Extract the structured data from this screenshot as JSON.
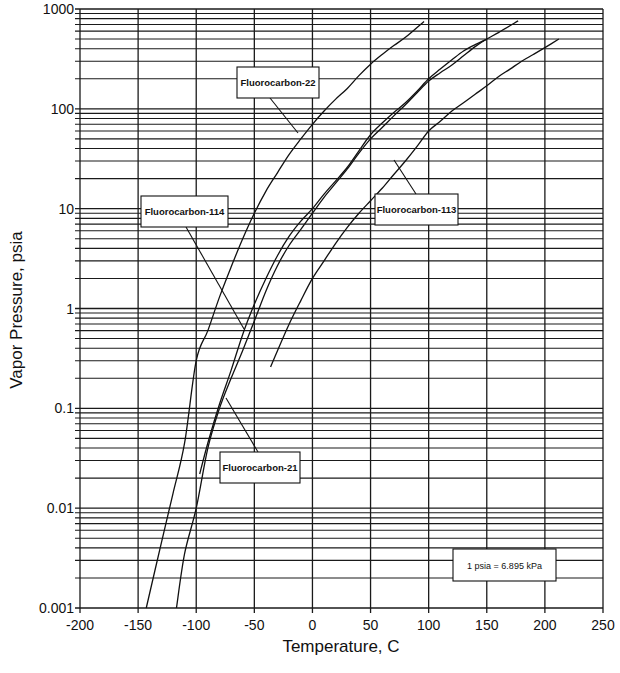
{
  "chart_data": {
    "type": "line",
    "title": "",
    "xlabel": "Temperature, C",
    "ylabel": "Vapor Pressure, psia",
    "xlim": [
      -200,
      250
    ],
    "ylim": [
      0.001,
      1000
    ],
    "yscale": "log",
    "grid": true,
    "x_ticks": [
      -200,
      -150,
      -100,
      -50,
      0,
      50,
      100,
      150,
      200,
      250
    ],
    "x_tick_labels": [
      "-200",
      "-150",
      "-100",
      "-50",
      "0",
      "50",
      "100",
      "150",
      "200",
      "250"
    ],
    "y_ticks": [
      0.001,
      0.01,
      0.1,
      1,
      10,
      100,
      1000
    ],
    "y_tick_labels": [
      "0.001",
      "0.01",
      "0.1",
      "1",
      "10",
      "100",
      "1000"
    ],
    "legend_position": "inline callout labels",
    "annotations": [
      {
        "text": "Fluorocarbon-22",
        "box": [
          237,
          67,
          82,
          31
        ],
        "pointer": [
          [
            270,
            98
          ],
          [
            298,
            133
          ]
        ]
      },
      {
        "text": "Fluorocarbon-114",
        "box": [
          141,
          196,
          87,
          31
        ],
        "pointer": [
          [
            186,
            227
          ],
          [
            244,
            329
          ]
        ]
      },
      {
        "text": "Fluorocarbon-113",
        "box": [
          375,
          194,
          83,
          31
        ],
        "pointer": [
          [
            416,
            194
          ],
          [
            394,
            160
          ]
        ]
      },
      {
        "text": "Fluorocarbon-21",
        "box": [
          220,
          452,
          80,
          31
        ],
        "pointer": [
          [
            258,
            452
          ],
          [
            226,
            398
          ]
        ]
      },
      {
        "text": "1 psia = 6.895 kPa",
        "box": [
          453,
          549,
          103,
          32
        ],
        "pointer": []
      }
    ],
    "series": [
      {
        "name": "Fluorocarbon-22",
        "x": [
          -143,
          -130,
          -120,
          -110,
          -100,
          -90,
          -80,
          -70,
          -60,
          -50,
          -40,
          -30,
          -20,
          -10,
          0,
          10,
          20,
          30,
          40,
          50,
          60,
          70,
          80,
          96
        ],
        "y": [
          0.001,
          0.0045,
          0.014,
          0.045,
          0.3,
          0.6,
          1.3,
          2.6,
          5.0,
          9.0,
          15,
          23,
          35,
          50,
          70,
          95,
          125,
          160,
          215,
          280,
          350,
          430,
          520,
          750
        ]
      },
      {
        "name": "Fluorocarbon-21",
        "x": [
          -97,
          -90,
          -80,
          -70,
          -60,
          -50,
          -40,
          -30,
          -20,
          -10,
          0,
          10,
          20,
          30,
          40,
          50,
          60,
          70,
          80,
          90,
          100,
          110,
          120,
          130,
          140,
          150
        ],
        "y": [
          0.022,
          0.045,
          0.11,
          0.24,
          0.55,
          1.1,
          2.0,
          3.4,
          5.3,
          7.5,
          10,
          14,
          19,
          26,
          38,
          55,
          72,
          92,
          115,
          150,
          200,
          250,
          310,
          380,
          440,
          500
        ]
      },
      {
        "name": "Fluorocarbon-114",
        "x": [
          -117,
          -110,
          -100,
          -90,
          -80,
          -70,
          -60,
          -50,
          -40,
          -30,
          -20,
          -10,
          0,
          10,
          20,
          30,
          40,
          50,
          60,
          70,
          80,
          90,
          100,
          110,
          120,
          130,
          140,
          150,
          160,
          177
        ],
        "y": [
          0.001,
          0.0035,
          0.01,
          0.04,
          0.1,
          0.2,
          0.38,
          0.75,
          1.5,
          2.7,
          4.3,
          6.2,
          9,
          13,
          18,
          25,
          36,
          50,
          65,
          85,
          110,
          145,
          190,
          230,
          275,
          340,
          420,
          500,
          580,
          760
        ]
      },
      {
        "name": "Fluorocarbon-113",
        "x": [
          -36,
          -30,
          -20,
          -10,
          0,
          10,
          20,
          30,
          40,
          50,
          60,
          70,
          80,
          90,
          100,
          110,
          120,
          130,
          140,
          150,
          160,
          170,
          180,
          190,
          200,
          212
        ],
        "y": [
          0.26,
          0.38,
          0.7,
          1.2,
          2.0,
          3.0,
          4.5,
          6.5,
          9,
          12,
          16,
          22,
          30,
          42,
          60,
          75,
          95,
          115,
          140,
          170,
          210,
          250,
          300,
          350,
          410,
          500
        ]
      }
    ]
  }
}
